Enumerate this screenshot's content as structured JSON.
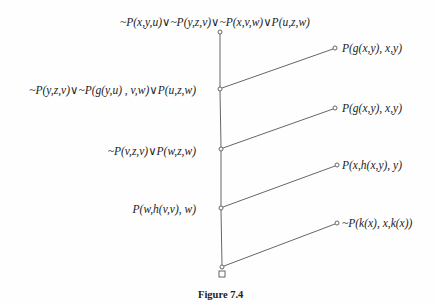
{
  "figure": {
    "caption": "Figure 7.4",
    "type": "linear resolution refutation tree"
  },
  "spine": [
    {
      "id": "n0",
      "x": 220,
      "y": 32,
      "label": "~P(x,y,u)∨~P(y,z,v)∨~P(x,v,w)∨P(u,z,w)",
      "label_pos": "above"
    },
    {
      "id": "n1",
      "x": 220,
      "y": 89,
      "label": "~P(y,z,v)∨~P(g(y,u) , v,w)∨P(u,z,w)",
      "label_pos": "left"
    },
    {
      "id": "n2",
      "x": 221,
      "y": 149,
      "label": "~P(v,z,v)∨P(w,z,w)",
      "label_pos": "left"
    },
    {
      "id": "n3",
      "x": 221,
      "y": 208,
      "label": "P(w,h(v,v), w)",
      "label_pos": "left"
    },
    {
      "id": "n4",
      "x": 222,
      "y": 267,
      "label": "□",
      "label_pos": "below"
    }
  ],
  "side_clauses": [
    {
      "id": "s1",
      "x": 335,
      "y": 48,
      "label": "P(g(x,y), x,y)",
      "joins": "n1"
    },
    {
      "id": "s2",
      "x": 335,
      "y": 108,
      "label": "P(g(x,y), x,y)",
      "joins": "n2"
    },
    {
      "id": "s3",
      "x": 337,
      "y": 165,
      "label": "P(x,h(x,y), y)",
      "joins": "n3"
    },
    {
      "id": "s4",
      "x": 337,
      "y": 223,
      "label": "~P(k(x), x,k(x))",
      "joins": "n4"
    }
  ],
  "empty_clause_symbol": "□",
  "colors": {
    "line": "#555555",
    "text": "#222222",
    "background": "#fefefe"
  }
}
